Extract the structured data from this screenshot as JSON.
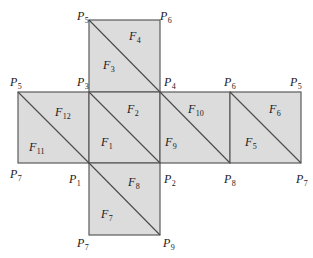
{
  "diagram": {
    "type": "cube-net-triangulation",
    "fill_color": "#dcdcdc",
    "line_color": "#4a4a4a",
    "squares": [
      {
        "id": "top",
        "x": 89,
        "y": 20,
        "size": 71
      },
      {
        "id": "middle-left",
        "x": 18,
        "y": 92,
        "size": 71
      },
      {
        "id": "middle-center",
        "x": 89,
        "y": 92,
        "size": 71
      },
      {
        "id": "middle-right",
        "x": 160,
        "y": 92,
        "size": 71
      },
      {
        "id": "far-right",
        "x": 230,
        "y": 92,
        "size": 71
      },
      {
        "id": "bottom",
        "x": 89,
        "y": 163,
        "size": 71
      }
    ],
    "faces": [
      {
        "name": "F",
        "sub": "1",
        "x": 101,
        "y": 136
      },
      {
        "name": "F",
        "sub": "2",
        "x": 127,
        "y": 103
      },
      {
        "name": "F",
        "sub": "3",
        "x": 103,
        "y": 59
      },
      {
        "name": "F",
        "sub": "4",
        "x": 129,
        "y": 30
      },
      {
        "name": "F",
        "sub": "5",
        "x": 245,
        "y": 136
      },
      {
        "name": "F",
        "sub": "6",
        "x": 269,
        "y": 103
      },
      {
        "name": "F",
        "sub": "7",
        "x": 101,
        "y": 208
      },
      {
        "name": "F",
        "sub": "8",
        "x": 128,
        "y": 176
      },
      {
        "name": "F",
        "sub": "9",
        "x": 165,
        "y": 136
      },
      {
        "name": "F",
        "sub": "10",
        "x": 188,
        "y": 103
      },
      {
        "name": "F",
        "sub": "11",
        "x": 29,
        "y": 141
      },
      {
        "name": "F",
        "sub": "12",
        "x": 55,
        "y": 106
      }
    ],
    "vertices": [
      {
        "name": "P",
        "sub": "5",
        "x": 77,
        "y": 10
      },
      {
        "name": "P",
        "sub": "6",
        "x": 160,
        "y": 10
      },
      {
        "name": "P",
        "sub": "5",
        "x": 10,
        "y": 76
      },
      {
        "name": "P",
        "sub": "3",
        "x": 77,
        "y": 76
      },
      {
        "name": "P",
        "sub": "4",
        "x": 164,
        "y": 76
      },
      {
        "name": "P",
        "sub": "6",
        "x": 224,
        "y": 76
      },
      {
        "name": "P",
        "sub": "5",
        "x": 290,
        "y": 76
      },
      {
        "name": "P",
        "sub": "7",
        "x": 10,
        "y": 168
      },
      {
        "name": "P",
        "sub": "1",
        "x": 69,
        "y": 173
      },
      {
        "name": "P",
        "sub": "2",
        "x": 164,
        "y": 173
      },
      {
        "name": "P",
        "sub": "8",
        "x": 224,
        "y": 173
      },
      {
        "name": "P",
        "sub": "7",
        "x": 296,
        "y": 173
      },
      {
        "name": "P",
        "sub": "7",
        "x": 77,
        "y": 237
      },
      {
        "name": "P",
        "sub": "9",
        "x": 163,
        "y": 237
      }
    ]
  }
}
